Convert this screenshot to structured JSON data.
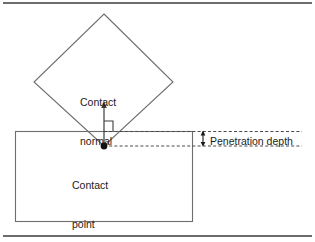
{
  "figure": {
    "type": "technical-diagram",
    "background_color": "#ffffff",
    "rules": {
      "stroke_color": "#3c3c3c",
      "top_rule_y": 3,
      "bottom_rule_y": 236
    },
    "shapes": {
      "diamond": {
        "name": "rotated-square-body",
        "stroke_color": "#6e6e6e",
        "fill": "none",
        "vertices": [
          {
            "x": 104,
            "y": 14
          },
          {
            "x": 173,
            "y": 82
          },
          {
            "x": 104,
            "y": 146
          },
          {
            "x": 34,
            "y": 82
          }
        ]
      },
      "ground_rectangle": {
        "name": "ground-body",
        "stroke_color": "#6e6e6e",
        "fill": "none",
        "x": 15,
        "y": 131,
        "width": 178,
        "height": 91
      }
    },
    "contact_point": {
      "x": 104,
      "y": 146,
      "marker": "filled-circle",
      "radius": 3.2,
      "color": "#101010"
    },
    "contact_normal_arrow": {
      "from_x": 104,
      "from_y": 146,
      "to_x": 104,
      "to_y": 102,
      "color": "#3c3c3c",
      "arrowhead": "up"
    },
    "right_angle_marker": {
      "x": 104,
      "y": 131,
      "size": 9,
      "color": "#3c3c3c"
    },
    "dashed_lines": {
      "color": "#4a4a4a",
      "dash_pattern": "3 2",
      "surface_line_y": 131,
      "penetration_line_y": 146,
      "x_start": 104,
      "x_end": 302
    },
    "penetration_measure_arrow": {
      "x": 203,
      "top_y": 131,
      "bottom_y": 146,
      "color": "#1b1b1b",
      "arrowhead": "both"
    }
  },
  "labels": {
    "contact_normal": "Contact\nnormal",
    "contact_normal_line1": "Contact",
    "contact_normal_line2": "normal",
    "contact_point": "Contact\npoint",
    "contact_point_line1": "Contact",
    "contact_point_line2": "point",
    "penetration_depth": "Penetration depth"
  }
}
